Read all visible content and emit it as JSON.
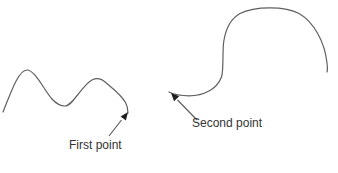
{
  "figure": {
    "labels": {
      "first_point": "First point",
      "second_point": "Second point"
    },
    "colors": {
      "background": "#ffffff",
      "line": "#5f5f5f",
      "arrowhead": "#1f1f1f",
      "text": "#333333"
    }
  }
}
